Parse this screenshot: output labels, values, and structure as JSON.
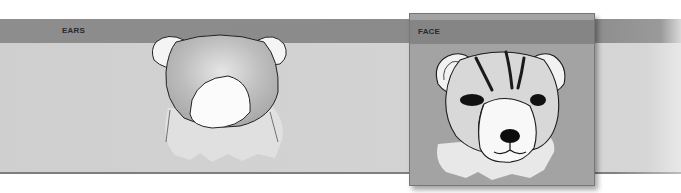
{
  "panels": [
    {
      "id": "ears",
      "label": "EARS",
      "image": "ears-sketch"
    },
    {
      "id": "face",
      "label": "FACE",
      "image": "face-sketch",
      "highlighted": true
    }
  ],
  "colors": {
    "header_band": "#8d8d8d",
    "body_band": "#d1d1d1",
    "face_panel": "#a3a3a3",
    "label_text": "#2a2a2a",
    "sketch_outline": "#1a1a1a"
  }
}
